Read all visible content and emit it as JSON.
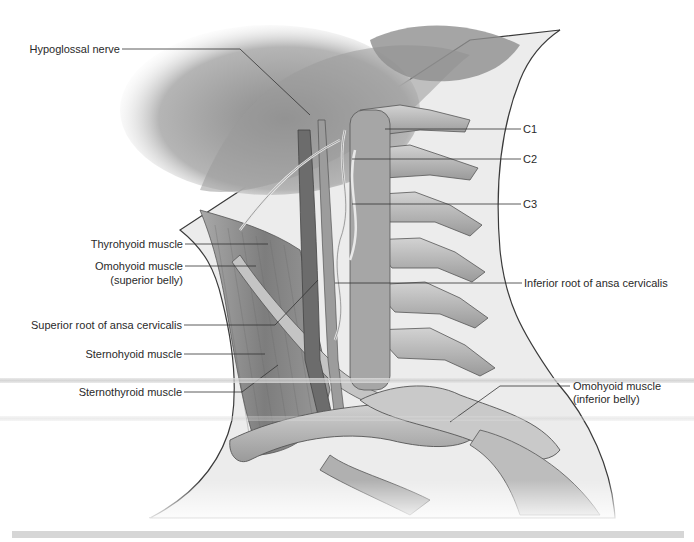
{
  "figure": {
    "colors": {
      "background": "#ffffff",
      "neck_fill": "#ececec",
      "outline": "#3a3a3a",
      "muscle": "#8f8f8f",
      "bone": "#b8b8b8",
      "leader": "#333333",
      "text": "#2a2a2a"
    }
  },
  "labels": {
    "left": [
      {
        "id": "hypoglossal-nerve",
        "text": "Hypoglossal nerve"
      },
      {
        "id": "thyrohyoid-muscle",
        "text": "Thyrohyoid muscle"
      },
      {
        "id": "omohyoid-superior-1",
        "text": "Omohyoid muscle"
      },
      {
        "id": "omohyoid-superior-2",
        "text": "(superior belly)"
      },
      {
        "id": "superior-root-ansa",
        "text": "Superior root of ansa cervicalis"
      },
      {
        "id": "sternohyoid-muscle",
        "text": "Sternohyoid muscle"
      },
      {
        "id": "sternothyroid-muscle",
        "text": "Sternothyroid muscle"
      }
    ],
    "right": [
      {
        "id": "c1",
        "text": "C1"
      },
      {
        "id": "c2",
        "text": "C2"
      },
      {
        "id": "c3",
        "text": "C3"
      },
      {
        "id": "inferior-root-ansa",
        "text": "Inferior root of ansa cervicalis"
      },
      {
        "id": "omohyoid-inferior-1",
        "text": "Omohyoid muscle"
      },
      {
        "id": "omohyoid-inferior-2",
        "text": "(inferior belly)"
      }
    ]
  }
}
